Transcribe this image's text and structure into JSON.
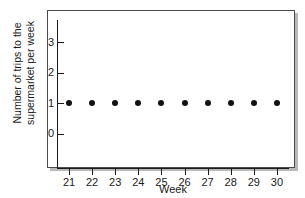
{
  "chart_data": {
    "type": "scatter",
    "title": "",
    "xlabel": "Week",
    "ylabel_lines": [
      "Number of trips to the",
      "supermarket per week"
    ],
    "ylabel": "Number of trips to the supermarket per week",
    "x": [
      21,
      22,
      23,
      24,
      25,
      26,
      27,
      28,
      29,
      30
    ],
    "values": [
      1,
      1,
      1,
      1,
      1,
      1,
      1,
      1,
      1,
      1
    ],
    "categories": [
      "21",
      "22",
      "23",
      "24",
      "25",
      "26",
      "27",
      "28",
      "29",
      "30"
    ],
    "xtick_labels": [
      "21",
      "22",
      "23",
      "24",
      "25",
      "26",
      "27",
      "28",
      "29",
      "30"
    ],
    "ytick_labels": [
      "0",
      "1",
      "2",
      "3"
    ],
    "ytick_values": [
      0,
      1,
      2,
      3
    ],
    "ylim": [
      -0.45,
      3.55
    ],
    "xlim": [
      20.4,
      30.8
    ],
    "grid": false,
    "legend": false,
    "marker": "filled-circle",
    "marker_color": "#111111",
    "axis_color": "#1a1a1a",
    "background_color": "#ffffff",
    "frame_border_color": "#4a4a4a",
    "shadow_color": "#b9b9b9"
  }
}
